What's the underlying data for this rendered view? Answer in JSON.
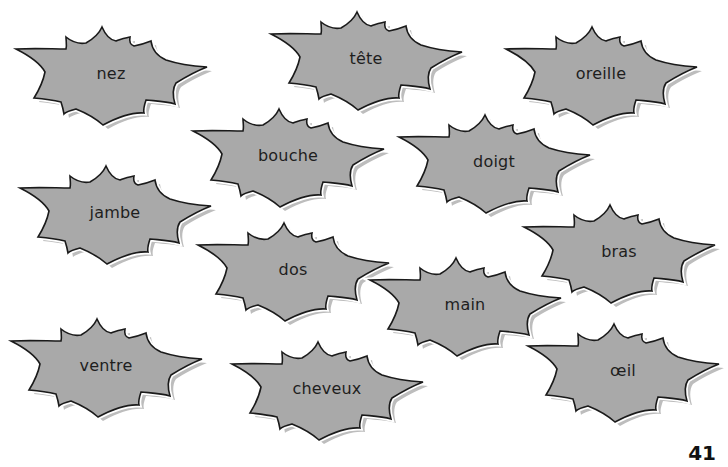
{
  "worksheet": {
    "words": [
      {
        "id": "nez",
        "label": "nez",
        "x": 16,
        "y": 27
      },
      {
        "id": "tete",
        "label": "tête",
        "x": 271,
        "y": 12
      },
      {
        "id": "oreille",
        "label": "oreille",
        "x": 506,
        "y": 27
      },
      {
        "id": "bouche",
        "label": "bouche",
        "x": 193,
        "y": 109
      },
      {
        "id": "doigt",
        "label": "doigt",
        "x": 399,
        "y": 115
      },
      {
        "id": "jambe",
        "label": "jambe",
        "x": 20,
        "y": 166
      },
      {
        "id": "bras",
        "label": "bras",
        "x": 524,
        "y": 205
      },
      {
        "id": "dos",
        "label": "dos",
        "x": 198,
        "y": 223
      },
      {
        "id": "main",
        "label": "main",
        "x": 370,
        "y": 258
      },
      {
        "id": "ventre",
        "label": "ventre",
        "x": 11,
        "y": 319
      },
      {
        "id": "cheveux",
        "label": "cheveux",
        "x": 232,
        "y": 342
      },
      {
        "id": "oeil",
        "label": "œil",
        "x": 528,
        "y": 324
      }
    ],
    "page_number": "41"
  },
  "colors": {
    "burst_fill": "#a9a9a9",
    "burst_stroke": "#1a1a1a",
    "burst_shadow": "#b8b8b8",
    "burst_highlight": "#ffffff",
    "text": "#1e1e1e",
    "background": "#ffffff"
  }
}
